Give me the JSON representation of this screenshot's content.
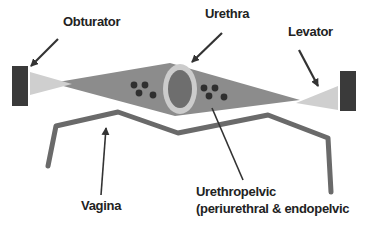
{
  "diagram": {
    "type": "anatomical schematic",
    "labels": {
      "obturator": "Obturator",
      "urethra": "Urethra",
      "levator": "Levator",
      "vagina": "Vagina",
      "urethropelvic_line1": "Urethropelvic",
      "urethropelvic_line2": "(periurethral & endopelvic"
    },
    "colors": {
      "background": "#ffffff",
      "anchor_block": "#3a3a3a",
      "ligament": "#8c8c8c",
      "muscle_wedge": "#cfcfcf",
      "urethra_ring": "#cccccc",
      "urethra_lumen": "#6e6e6e",
      "dots": "#2f2f2f",
      "vagina_line": "#6a6a6a",
      "arrow": "#333333",
      "text": "#222222"
    }
  }
}
